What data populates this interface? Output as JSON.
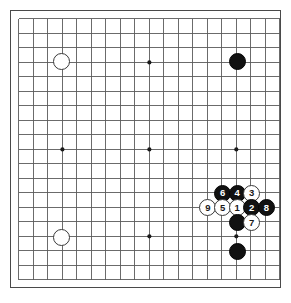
{
  "diagram": {
    "kind": "go-board-diagram",
    "board_size": 19,
    "title": "",
    "background_color": "#ffffff",
    "line_color": "#5a5a5a",
    "border_color": "#4a4a4a",
    "black_color": "#111111",
    "white_color": "#ffffff"
  },
  "geometry": {
    "origin_x": 18,
    "origin_y": 18,
    "spacing": 14.6,
    "stone_diameter": 17,
    "star_radius": 2.1
  },
  "star_points": [
    {
      "col": 4,
      "row": 4
    },
    {
      "col": 10,
      "row": 4
    },
    {
      "col": 16,
      "row": 4
    },
    {
      "col": 4,
      "row": 10
    },
    {
      "col": 10,
      "row": 10
    },
    {
      "col": 16,
      "row": 10
    },
    {
      "col": 4,
      "row": 16
    },
    {
      "col": 10,
      "row": 16
    },
    {
      "col": 16,
      "row": 16
    }
  ],
  "stones": [
    {
      "id": "w-upper-left-hoshi",
      "color": "white",
      "col": 4,
      "row": 4,
      "label": ""
    },
    {
      "id": "b-upper-right-hoshi",
      "color": "black",
      "col": 16,
      "row": 4,
      "label": ""
    },
    {
      "id": "w-lower-left-hoshi",
      "color": "white",
      "col": 4,
      "row": 16,
      "label": ""
    },
    {
      "id": "b-move-6",
      "color": "black",
      "col": 15,
      "row": 13,
      "label": "6"
    },
    {
      "id": "b-move-4",
      "color": "black",
      "col": 16,
      "row": 13,
      "label": "4"
    },
    {
      "id": "w-move-3",
      "color": "white",
      "col": 17,
      "row": 13,
      "label": "3"
    },
    {
      "id": "w-move-9",
      "color": "white",
      "col": 14,
      "row": 14,
      "label": "9"
    },
    {
      "id": "w-move-5",
      "color": "white",
      "col": 15,
      "row": 14,
      "label": "5"
    },
    {
      "id": "w-move-1",
      "color": "white",
      "col": 16,
      "row": 14,
      "label": "1"
    },
    {
      "id": "b-move-2",
      "color": "black",
      "col": 17,
      "row": 14,
      "label": "2"
    },
    {
      "id": "b-move-8",
      "color": "black",
      "col": 18,
      "row": 14,
      "label": "8"
    },
    {
      "id": "b-existing-r15",
      "color": "black",
      "col": 16,
      "row": 15,
      "label": ""
    },
    {
      "id": "w-move-7",
      "color": "white",
      "col": 17,
      "row": 15,
      "label": "7"
    },
    {
      "id": "b-existing-r17",
      "color": "black",
      "col": 16,
      "row": 17,
      "label": ""
    }
  ]
}
